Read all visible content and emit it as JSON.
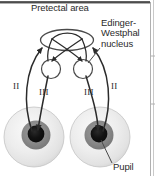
{
  "figure": {
    "title_label": "Pretectal area",
    "labels": {
      "pretectal_area": "Pretectal area",
      "edinger_line1": "Edinger-",
      "edinger_line2": "Westphal",
      "edinger_line3": "nucleus",
      "nerve_left_optic": "II",
      "nerve_left_oculomotor": "III",
      "nerve_right_oculomotor": "III",
      "nerve_right_optic": "II",
      "pupil": "Pupil"
    },
    "colors": {
      "background": "#ffffff",
      "stroke": "#2b2b2b",
      "text": "#2b2b2b",
      "border_top": "#3a3a3a",
      "panel_divider": "#b8b8b8",
      "sclera_outer": "#e8e8e8",
      "sclera_inner": "#f4f4f4",
      "iris": "#8c8c8c",
      "pupil_fill": "#141414"
    },
    "structures": {
      "pretectal_nucleus_shape": "ellipse",
      "edinger_westphal_shape": "circle",
      "eye_count": 2,
      "arrow_count": 4
    }
  }
}
